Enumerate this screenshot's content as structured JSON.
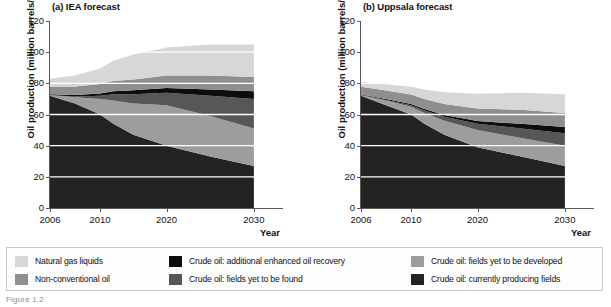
{
  "figure": {
    "ylabel": "Oil production (million barrels/day)",
    "xlabel": "Year",
    "caption_stub": "Figure 1.2"
  },
  "colors": {
    "natural_gas_liquids": "#d7d7d7",
    "non_conventional_oil": "#8f8f8f",
    "eor": "#0d0d0d",
    "yet_to_be_found": "#575757",
    "yet_to_be_developed": "#9d9d9d",
    "currently_producing": "#232323",
    "gridline": "#ffffff",
    "axis": "#5a5a5a",
    "text": "#111111",
    "legend_border": "#c9c9c9"
  },
  "legend": {
    "columns": [
      [
        {
          "label": "Natural gas liquids",
          "swatch": "natural_gas_liquids",
          "color": "#d7d7d7"
        },
        {
          "label": "Non-conventional oil",
          "swatch": "non_conventional_oil",
          "color": "#8f8f8f"
        }
      ],
      [
        {
          "label": "Crude oil: additional enhanced oil recovery",
          "swatch": "eor",
          "color": "#0d0d0d"
        },
        {
          "label": "Crude oil: fields yet to be found",
          "swatch": "yet_to_be_found",
          "color": "#575757"
        }
      ],
      [
        {
          "label": "Crude oil: fields yet to be developed",
          "swatch": "yet_to_be_developed",
          "color": "#9d9d9d"
        },
        {
          "label": "Crude oil: currently producing fields",
          "swatch": "currently_producing",
          "color": "#232323"
        }
      ]
    ]
  },
  "chart_data": [
    {
      "type": "area",
      "id": "iea",
      "title": "(a) IEA forecast",
      "xlabel": "Year",
      "ylabel": "Oil production (million barrels/day)",
      "stacked": true,
      "grid": true,
      "legend_position": "below-figure",
      "xlim": [
        2006,
        2030
      ],
      "ylim": [
        0,
        120
      ],
      "yticks": [
        0,
        20,
        40,
        60,
        80,
        100,
        120
      ],
      "xticks": [
        2006,
        2010,
        2020,
        2030
      ],
      "xtick_positions": [
        0.0,
        0.215,
        0.5,
        0.875
      ],
      "x": [
        2006,
        2008,
        2010,
        2012,
        2015,
        2020,
        2025,
        2030
      ],
      "series": [
        {
          "name": "Crude oil: currently producing fields",
          "color": "#232323",
          "values": [
            72,
            67,
            60,
            54,
            47,
            40,
            33,
            27
          ]
        },
        {
          "name": "Crude oil: fields yet to be developed",
          "color": "#9d9d9d",
          "values": [
            0.5,
            4,
            10,
            15,
            20,
            26,
            26,
            24
          ]
        },
        {
          "name": "Crude oil: fields yet to be found",
          "color": "#575757",
          "values": [
            0,
            0.5,
            2,
            4,
            6,
            8,
            13,
            19
          ]
        },
        {
          "name": "Crude oil: additional enhanced oil recovery",
          "color": "#0d0d0d",
          "values": [
            0.5,
            1,
            1.5,
            2,
            2.5,
            3,
            4,
            5
          ]
        },
        {
          "name": "Non-conventional oil",
          "color": "#8f8f8f",
          "values": [
            5,
            5.5,
            6,
            6.5,
            7,
            8,
            9,
            9
          ]
        },
        {
          "name": "Natural gas liquids",
          "color": "#d7d7d7",
          "values": [
            5,
            7,
            10,
            13,
            16,
            18,
            20,
            21
          ]
        }
      ],
      "totals": [
        83,
        85,
        89.5,
        94.5,
        98.5,
        103,
        105,
        105
      ]
    },
    {
      "type": "area",
      "id": "uppsala",
      "title": "(b) Uppsala forecast",
      "xlabel": "Year",
      "ylabel": "Oil production (million barrels/day)",
      "stacked": true,
      "grid": true,
      "legend_position": "below-figure",
      "xlim": [
        2006,
        2030
      ],
      "ylim": [
        0,
        120
      ],
      "yticks": [
        0,
        20,
        40,
        60,
        80,
        100,
        120
      ],
      "xticks": [
        2006,
        2010,
        2020,
        2030
      ],
      "xtick_positions": [
        0.0,
        0.215,
        0.5,
        0.875
      ],
      "x": [
        2006,
        2008,
        2010,
        2012,
        2015,
        2020,
        2025,
        2030
      ],
      "series": [
        {
          "name": "Crude oil: currently producing fields",
          "color": "#232323",
          "values": [
            72,
            66,
            60,
            54,
            47,
            39,
            33,
            27
          ]
        },
        {
          "name": "Crude oil: fields yet to be developed",
          "color": "#9d9d9d",
          "values": [
            0.5,
            3,
            5,
            7,
            9,
            11,
            12,
            13
          ]
        },
        {
          "name": "Crude oil: fields yet to be found",
          "color": "#575757",
          "values": [
            0,
            0.3,
            1,
            1.5,
            2.5,
            4,
            6,
            8
          ]
        },
        {
          "name": "Crude oil: additional enhanced oil recovery",
          "color": "#0d0d0d",
          "values": [
            0.3,
            0.6,
            0.8,
            1,
            1.2,
            1.8,
            3,
            4
          ]
        },
        {
          "name": "Non-conventional oil",
          "color": "#8f8f8f",
          "values": [
            5,
            5.5,
            6,
            6.5,
            7,
            8,
            9,
            9
          ]
        },
        {
          "name": "Natural gas liquids",
          "color": "#d7d7d7",
          "values": [
            3.2,
            4,
            5,
            6,
            7.5,
            9.5,
            11,
            12
          ]
        }
      ],
      "totals": [
        81,
        79.4,
        77.8,
        76,
        74.2,
        73.3,
        74,
        73
      ]
    }
  ]
}
